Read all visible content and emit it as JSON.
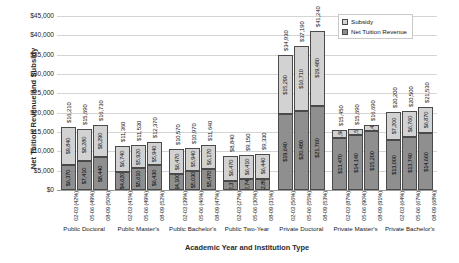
{
  "chart_data": {
    "type": "bar",
    "subtype": "stacked-grouped-bar",
    "title": "",
    "xlabel": "Academic Year and Institution Type",
    "ylabel": "Net Tuition Revenue and Subsidy",
    "ylim": [
      0,
      45000
    ],
    "ytick_values": [
      0,
      5000,
      10000,
      15000,
      20000,
      25000,
      30000,
      35000,
      40000,
      45000
    ],
    "ytick_labels": [
      "$0",
      "$5,000",
      "$10,000",
      "$15,000",
      "$20,000",
      "$25,000",
      "$30,000",
      "$35,000",
      "$40,000",
      "$45,000"
    ],
    "grid": true,
    "legend_position": "top-right",
    "legend": [
      "Subsidy",
      "Net Tuition Revenue"
    ],
    "series": [
      {
        "name": "Subsidy",
        "color": "#d2d2d2"
      },
      {
        "name": "Net Tuition Revenue",
        "color": "#8f8f8f"
      }
    ],
    "groups": [
      {
        "name": "Public Doctoral",
        "bars": [
          {
            "year": "02-03",
            "pct": "42%",
            "tick": "02-03 (42%)",
            "tuition": 6370,
            "subsidy": 9840,
            "total": 16210,
            "tuition_label": "$6,370",
            "subsidy_label": "$9,840",
            "total_label": "$16,210"
          },
          {
            "year": "05-06",
            "pct": "49%",
            "tick": "05-06 (49%)",
            "tuition": 7410,
            "subsidy": 8280,
            "total": 15690,
            "tuition_label": "$7,410",
            "subsidy_label": "$8,280",
            "total_label": "$15,690"
          },
          {
            "year": "08-09",
            "pct": "50%",
            "tick": "08-09 (50%)",
            "tuition": 8440,
            "subsidy": 8290,
            "total": 16730,
            "tuition_label": "$8,440",
            "subsidy_label": "$8,290",
            "total_label": "$16,730"
          }
        ]
      },
      {
        "name": "Public Master's",
        "bars": [
          {
            "year": "02-03",
            "pct": "41%",
            "tick": "02-03 (41%)",
            "tuition": 4620,
            "subsidy": 6740,
            "total": 11360,
            "tuition_label": "$4,620",
            "subsidy_label": "$6,740",
            "total_label": "$11,360"
          },
          {
            "year": "05-06",
            "pct": "49%",
            "tick": "05-06 (49%)",
            "tuition": 5610,
            "subsidy": 5920,
            "total": 11530,
            "tuition_label": "$5,610",
            "subsidy_label": "$5,920",
            "total_label": "$11,530"
          },
          {
            "year": "08-09",
            "pct": "52%",
            "tick": "08-09 (52%)",
            "tuition": 6430,
            "subsidy": 5940,
            "total": 12370,
            "tuition_label": "$6,430",
            "subsidy_label": "$5,940",
            "total_label": "$12,370"
          }
        ]
      },
      {
        "name": "Public Bachelor's",
        "bars": [
          {
            "year": "02-03",
            "pct": "39%",
            "tick": "02-03 (39%)",
            "tuition": 4100,
            "subsidy": 6470,
            "total": 10570,
            "tuition_label": "$4,100",
            "subsidy_label": "$6,470",
            "total_label": "$10,570"
          },
          {
            "year": "05-06",
            "pct": "46%",
            "tick": "05-06 (46%)",
            "tuition": 5030,
            "subsidy": 5940,
            "total": 10970,
            "tuition_label": "$5,030",
            "subsidy_label": "$5,940",
            "total_label": "$10,970"
          },
          {
            "year": "08-09",
            "pct": "47%",
            "tick": "08-09 (47%)",
            "tuition": 5470,
            "subsidy": 6170,
            "total": 11640,
            "tuition_label": "$5,470",
            "subsidy_label": "$6,170",
            "total_label": "$11,640"
          }
        ]
      },
      {
        "name": "Public Two-Year",
        "bars": [
          {
            "year": "02-03",
            "pct": "27%",
            "tick": "02-03 (27%)",
            "tuition": 2370,
            "subsidy": 6470,
            "total": 8840,
            "tuition_label": "$2,370",
            "subsidy_label": "$6,470",
            "total_label": "$8,840"
          },
          {
            "year": "05-06",
            "pct": "30%",
            "tick": "05-06 (30%)",
            "tuition": 2740,
            "subsidy": 6410,
            "total": 9150,
            "tuition_label": "$2,740",
            "subsidy_label": "$6,410",
            "total_label": "$9,150"
          },
          {
            "year": "08-09",
            "pct": "31%",
            "tick": "08-09 (31%)",
            "tuition": 2890,
            "subsidy": 6440,
            "total": 9330,
            "tuition_label": "$2,890",
            "subsidy_label": "$6,440",
            "total_label": "$9,330"
          }
        ]
      },
      {
        "name": "Private Doctoral",
        "bars": [
          {
            "year": "02-03",
            "pct": "56%",
            "tick": "02-03 (56%)",
            "tuition": 19640,
            "subsidy": 15290,
            "total": 34930,
            "tuition_label": "$19,640",
            "subsidy_label": "$15,290",
            "total_label": "$34,930"
          },
          {
            "year": "05-06",
            "pct": "55%",
            "tick": "05-06 (55%)",
            "tuition": 20480,
            "subsidy": 16710,
            "total": 37190,
            "tuition_label": "$20,480",
            "subsidy_label": "$16,710",
            "total_label": "$37,190"
          },
          {
            "year": "08-09",
            "pct": "53%",
            "tick": "08-09 (53%)",
            "tuition": 21760,
            "subsidy": 19480,
            "total": 41240,
            "tuition_label": "$21,760",
            "subsidy_label": "$19,480",
            "total_label": "$41,240"
          }
        ]
      },
      {
        "name": "Private Master's",
        "bars": [
          {
            "year": "02-03",
            "pct": "87%",
            "tick": "02-03 (87%)",
            "tuition": 13470,
            "subsidy": 1980,
            "total": 15450,
            "tuition_label": "$13,470",
            "subsidy_label": "$1,980",
            "total_label": "$15,450"
          },
          {
            "year": "05-06",
            "pct": "90%",
            "tick": "05-06 (90%)",
            "tuition": 14140,
            "subsidy": 1550,
            "total": 15690,
            "tuition_label": "$14,140",
            "subsidy_label": "$1,550",
            "total_label": "$15,690"
          },
          {
            "year": "08-09",
            "pct": "91%",
            "tick": "08-09 (91%)",
            "tuition": 15200,
            "subsidy": 1490,
            "total": 16690,
            "tuition_label": "$15,200",
            "subsidy_label": "$1,490",
            "total_label": "$16,690"
          }
        ]
      },
      {
        "name": "Private Bachelor's",
        "bars": [
          {
            "year": "02-03",
            "pct": "64%",
            "tick": "02-03 (64%)",
            "tuition": 13000,
            "subsidy": 7200,
            "total": 20200,
            "tuition_label": "$13,000",
            "subsidy_label": "$7,200",
            "total_label": "$20,200"
          },
          {
            "year": "05-06",
            "pct": "67%",
            "tick": "05-06 (67%)",
            "tuition": 13740,
            "subsidy": 6760,
            "total": 20500,
            "tuition_label": "$13,740",
            "subsidy_label": "$6,760",
            "total_label": "$20,500"
          },
          {
            "year": "08-09",
            "pct": "68%",
            "tick": "08-09 (68%)",
            "tuition": 14660,
            "subsidy": 6870,
            "total": 21530,
            "tuition_label": "$14,660",
            "subsidy_label": "$6,870",
            "total_label": "$21,530"
          }
        ]
      }
    ]
  }
}
